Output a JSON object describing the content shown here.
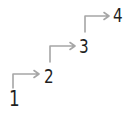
{
  "diagram": {
    "type": "staircase-steps",
    "steps": [
      {
        "label": "1"
      },
      {
        "label": "2"
      },
      {
        "label": "3"
      },
      {
        "label": "4"
      }
    ],
    "connectors": [
      {
        "from": "1",
        "to": "2"
      },
      {
        "from": "2",
        "to": "3"
      },
      {
        "from": "3",
        "to": "4"
      }
    ],
    "colors": {
      "text": "#1f1f1f",
      "arrow": "#a6a6a6"
    }
  }
}
